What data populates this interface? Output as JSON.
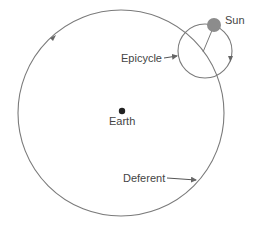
{
  "diagram": {
    "labels": {
      "sun": "Sun",
      "epicycle": "Epicycle",
      "earth": "Earth",
      "deferent": "Deferent"
    },
    "colors": {
      "line": "#7a7a7a",
      "sun": "#8c8c8c",
      "earth": "#222222",
      "text": "#444444",
      "background": "#ffffff"
    }
  }
}
